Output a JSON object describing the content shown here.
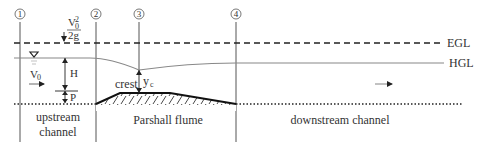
{
  "diagram": {
    "sections": [
      {
        "id": "1",
        "label": "①",
        "x": 20
      },
      {
        "id": "2",
        "label": "②",
        "x": 96
      },
      {
        "id": "3",
        "label": "③",
        "x": 139
      },
      {
        "id": "4",
        "label": "④",
        "x": 236
      }
    ],
    "lines": {
      "egl_label": "EGL",
      "hgl_label": "HGL"
    },
    "symbols": {
      "velocity_head_num": "V",
      "velocity_head_sub": "0",
      "velocity_head_sup": "2",
      "velocity_head_den": "2g",
      "upstream_velocity": "V",
      "upstream_velocity_sub": "0",
      "head": "H",
      "weir_height": "P",
      "crest": "crest",
      "critical_depth": "y",
      "critical_depth_sub": "c"
    },
    "regions": {
      "upstream_line1": "upstream",
      "upstream_line2": "channel",
      "flume": "Parshall flume",
      "downstream": "downstream channel"
    },
    "colors": {
      "line": "#333333",
      "hgl": "#888888",
      "text": "#333333"
    }
  }
}
